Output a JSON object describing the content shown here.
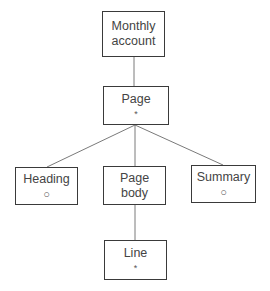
{
  "diagram": {
    "type": "tree",
    "nodes": [
      {
        "id": "monthly-account",
        "label": "Monthly\naccount",
        "mark": ""
      },
      {
        "id": "page",
        "label": "Page",
        "mark": "*"
      },
      {
        "id": "heading",
        "label": "Heading",
        "mark": "o"
      },
      {
        "id": "page-body",
        "label": "Page\nbody",
        "mark": ""
      },
      {
        "id": "summary",
        "label": "Summary",
        "mark": "o"
      },
      {
        "id": "line",
        "label": "Line",
        "mark": "*"
      }
    ],
    "edges": [
      {
        "from": "monthly-account",
        "to": "page"
      },
      {
        "from": "page",
        "to": "heading"
      },
      {
        "from": "page",
        "to": "page-body"
      },
      {
        "from": "page",
        "to": "summary"
      },
      {
        "from": "page-body",
        "to": "line"
      }
    ],
    "marks": {
      "o": "○",
      "*": "*"
    },
    "colors": {
      "border": "#3a3a3a",
      "line": "#7a7a7a",
      "text": "#444444"
    }
  }
}
